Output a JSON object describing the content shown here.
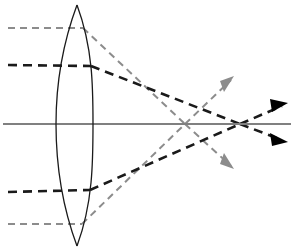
{
  "figure": {
    "width": 294,
    "height": 252,
    "background": "#ffffff"
  },
  "colors": {
    "axis": "#808080",
    "lens_outline": "#1a1a1a",
    "ray_primary": "#1a1a1a",
    "ray_secondary": "#8c8c8c",
    "arrowhead_primary": "#000000",
    "arrowhead_secondary": "#8c8c8c"
  },
  "optical_axis": {
    "label": "optical-axis",
    "x1": 3,
    "y1": 124,
    "x2": 291,
    "y2": 124,
    "stroke_width": 2.2,
    "style": "solid"
  },
  "lens": {
    "label": "biconvex-converging-lens",
    "type": "biconvex",
    "top_vertex_x": 77,
    "top_vertex_y": 5,
    "bottom_vertex_x": 77,
    "bottom_vertex_y": 246,
    "left_edge_x": 56,
    "right_edge_x": 93,
    "center_y": 124,
    "stroke_width": 1.3,
    "style": "solid",
    "left_surface_path": "M 77 5 C 61 48 56 88 56 124 C 56 161 61 203 77 246",
    "right_surface_path": "M 77 5 C 93 48 93 88 93 124 C 93 161 93 203 77 246"
  },
  "focal_points": [
    {
      "name": "focal-point-secondary",
      "x": 185,
      "y": 124,
      "belongs_to": "ray_group_secondary"
    },
    {
      "name": "focal-point-primary",
      "x": 240,
      "y": 124,
      "belongs_to": "ray_group_primary"
    }
  ],
  "ray_groups": [
    {
      "name": "ray-group-secondary",
      "color": "#8c8c8c",
      "dash": "7,5",
      "stroke_width": 2.0,
      "focus_x": 185,
      "focus_y": 124,
      "description": "Upper-field parallel ray bundle, converges at nearer focal point",
      "rays": [
        {
          "name": "ray-secondary-upper",
          "incoming": {
            "x1": 8,
            "y1": 28,
            "x2": 83,
            "y2": 28
          },
          "refracted": {
            "x1": 83,
            "y1": 28,
            "x2": 185,
            "y2": 124
          },
          "diverging": {
            "x1": 185,
            "y1": 124,
            "x2": 231,
            "y2": 166
          },
          "arrowhead": {
            "x": 233,
            "y": 168,
            "angle": 42,
            "filled": false
          }
        },
        {
          "name": "ray-secondary-lower",
          "incoming": {
            "x1": 8,
            "y1": 224,
            "x2": 82,
            "y2": 224
          },
          "refracted": {
            "x1": 82,
            "y1": 224,
            "x2": 185,
            "y2": 124
          },
          "diverging": {
            "x1": 185,
            "y1": 124,
            "x2": 231,
            "y2": 80
          },
          "arrowhead": {
            "x": 233,
            "y": 78,
            "angle": -44,
            "filled": false
          }
        }
      ]
    },
    {
      "name": "ray-group-primary",
      "color": "#1a1a1a",
      "dash": "9,6",
      "stroke_width": 2.6,
      "focus_x": 240,
      "focus_y": 124,
      "description": "Inner-field parallel ray bundle, converges at farther focal point",
      "rays": [
        {
          "name": "ray-primary-upper",
          "incoming": {
            "x1": 8,
            "y1": 65,
            "x2": 91,
            "y2": 66
          },
          "refracted": {
            "x1": 91,
            "y1": 66,
            "x2": 240,
            "y2": 124
          },
          "diverging": {
            "x1": 240,
            "y1": 124,
            "x2": 282,
            "y2": 140
          },
          "arrowhead": {
            "x": 285,
            "y": 141,
            "angle": 21,
            "filled": true
          }
        },
        {
          "name": "ray-primary-lower",
          "incoming": {
            "x1": 8,
            "y1": 192,
            "x2": 90,
            "y2": 190
          },
          "refracted": {
            "x1": 90,
            "y1": 190,
            "x2": 240,
            "y2": 124
          },
          "diverging": {
            "x1": 240,
            "y1": 124,
            "x2": 282,
            "y2": 106
          },
          "arrowhead": {
            "x": 285,
            "y": 105,
            "angle": -23,
            "filled": true
          }
        }
      ]
    }
  ]
}
